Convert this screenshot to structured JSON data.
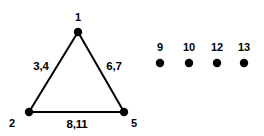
{
  "diagram": {
    "background_color": "#ffffff",
    "stroke_color": "#000000",
    "node_color": "#000000",
    "stroke_width": 2,
    "node_radius": 4.2,
    "triangle": {
      "vertices": [
        {
          "id": "v1",
          "label": "1",
          "x": 78,
          "y": 32,
          "label_x": 78,
          "label_y": 17
        },
        {
          "id": "v2",
          "label": "2",
          "x": 29,
          "y": 112,
          "label_x": 12,
          "label_y": 123
        },
        {
          "id": "v5",
          "label": "5",
          "x": 124,
          "y": 112,
          "label_x": 134,
          "label_y": 123
        }
      ],
      "edges": [
        {
          "id": "e-left",
          "from": "v1",
          "to": "v2",
          "label": "3,4",
          "label_x": 41,
          "label_y": 66
        },
        {
          "id": "e-right",
          "from": "v1",
          "to": "v5",
          "label": "6,7",
          "label_x": 114,
          "label_y": 66
        },
        {
          "id": "e-bottom",
          "from": "v2",
          "to": "v5",
          "label": "8,11",
          "label_x": 77,
          "label_y": 124
        }
      ]
    },
    "isolated_vertices": [
      {
        "id": "v9",
        "label": "9",
        "x": 160,
        "y": 63,
        "label_x": 160,
        "label_y": 47
      },
      {
        "id": "v10",
        "label": "10",
        "x": 189,
        "y": 63,
        "label_x": 189,
        "label_y": 47
      },
      {
        "id": "v12",
        "label": "12",
        "x": 217,
        "y": 63,
        "label_x": 217,
        "label_y": 47
      },
      {
        "id": "v13",
        "label": "13",
        "x": 244,
        "y": 63,
        "label_x": 244,
        "label_y": 47
      }
    ]
  }
}
